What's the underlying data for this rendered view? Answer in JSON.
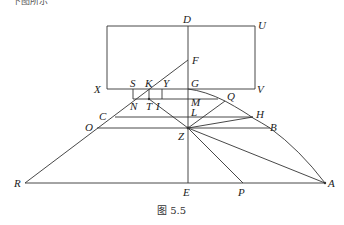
{
  "top_fragment": "下图所示",
  "caption": "图 5.5",
  "labels": {
    "D": "D",
    "U": "U",
    "F": "F",
    "X": "X",
    "S": "S",
    "K": "K",
    "Y": "Y",
    "G": "G",
    "V": "V",
    "N": "N",
    "T": "T",
    "I": "I",
    "M": "M",
    "Q": "Q",
    "C": "C",
    "L": "L",
    "H": "H",
    "O": "O",
    "B": "B",
    "Z": "Z",
    "R": "R",
    "E": "E",
    "P": "P",
    "A": "A"
  },
  "colors": {
    "stroke": "#333333",
    "text": "#222222",
    "background": "#ffffff"
  }
}
